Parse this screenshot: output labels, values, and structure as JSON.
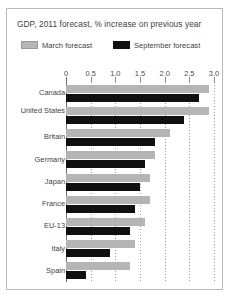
{
  "chart_data": {
    "type": "bar",
    "orientation": "horizontal",
    "title": "GDP, 2011 forecast, % increase on previous year",
    "xlabel": "",
    "ylabel": "",
    "xlim": [
      0,
      3.0
    ],
    "xticks": [
      0,
      0.5,
      1.0,
      1.5,
      2.0,
      2.5,
      3.0
    ],
    "xtick_labels": [
      "0",
      "0.5",
      "1.0",
      "1.5",
      "2.0",
      "2.5",
      "3.0"
    ],
    "grid": true,
    "grid_axis": "x",
    "legend_position": "top",
    "categories": [
      "Canada",
      "United States",
      "Britain",
      "Germany",
      "Japan",
      "France",
      "EU-13",
      "Italy",
      "Spain"
    ],
    "series": [
      {
        "name": "March forecast",
        "color": "#b5b5b5",
        "values": [
          2.9,
          2.9,
          2.1,
          1.8,
          1.7,
          1.7,
          1.6,
          1.4,
          1.3
        ]
      },
      {
        "name": "September forecast",
        "color": "#101010",
        "values": [
          2.7,
          2.4,
          1.8,
          1.6,
          1.5,
          1.4,
          1.3,
          0.9,
          0.4
        ]
      }
    ]
  },
  "legend": {
    "march": {
      "label": "March forecast",
      "swatch": "gray-swatch"
    },
    "september": {
      "label": "September forecast",
      "swatch": "black-swatch"
    }
  }
}
